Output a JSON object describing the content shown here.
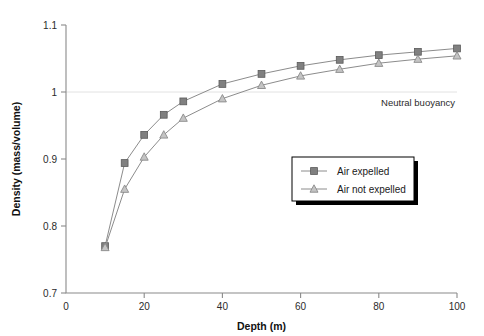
{
  "chart_data": {
    "type": "line",
    "title": "",
    "xlabel": "Depth (m)",
    "ylabel": "Density (mass/volume)",
    "xlim": [
      0,
      100
    ],
    "ylim": [
      0.7,
      1.1
    ],
    "xticks": [
      "0",
      "20",
      "40",
      "60",
      "80",
      "100"
    ],
    "xtick_values": [
      0,
      20,
      40,
      60,
      80,
      100
    ],
    "yticks": [
      "0.7",
      "0.8",
      "0.9",
      "1",
      "1.1"
    ],
    "ytick_values": [
      0.7,
      0.8,
      0.9,
      1.0,
      1.1
    ],
    "grid": "horizontal gridline at y = 1 only",
    "legend_position": "center-right inside plot area",
    "x": [
      10,
      15,
      20,
      25,
      30,
      40,
      50,
      60,
      70,
      80,
      90,
      100
    ],
    "series": [
      {
        "name": "Air expelled",
        "marker": "square",
        "color": "#808080",
        "values": [
          0.77,
          0.894,
          0.936,
          0.966,
          0.986,
          1.012,
          1.027,
          1.039,
          1.048,
          1.055,
          1.06,
          1.065
        ]
      },
      {
        "name": "Air not expelled",
        "marker": "triangle",
        "color": "#c4c4c4",
        "values": [
          0.768,
          0.855,
          0.903,
          0.936,
          0.961,
          0.99,
          1.01,
          1.024,
          1.034,
          1.043,
          1.049,
          1.054
        ]
      }
    ],
    "annotations": [
      {
        "text": "Neutral buoyancy",
        "x": 100,
        "y": 1.0,
        "align": "right-below"
      }
    ]
  },
  "legend": {
    "items": [
      {
        "label": "Air expelled",
        "marker": "square"
      },
      {
        "label": "Air not expelled",
        "marker": "triangle"
      }
    ]
  },
  "axes": {
    "x_title": "Depth (m)",
    "y_title": "Density (mass/volume)"
  },
  "annotation": {
    "neutral_buoyancy": "Neutral buoyancy"
  }
}
